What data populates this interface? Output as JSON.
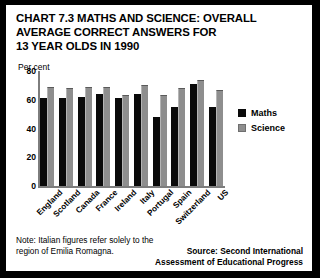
{
  "chart": {
    "title_lines": [
      "CHART 7.3 MATHS AND SCIENCE: OVERALL",
      "AVERAGE CORRECT ANSWERS FOR",
      "13 YEAR OLDS IN 1990"
    ],
    "axis_unit_label": "Per cent",
    "note": "Note: Italian figures refer solely to the region of Emilia Romagna.",
    "source_lines": [
      "Source: Second International",
      "Assessment of Educational Progress"
    ],
    "legend": [
      {
        "label": "Maths",
        "color": "#0a0a0a"
      },
      {
        "label": "Science",
        "color": "#8e8e8e"
      }
    ]
  },
  "chart_data": {
    "type": "bar",
    "title": "CHART 7.3 MATHS AND SCIENCE: OVERALL AVERAGE CORRECT ANSWERS FOR 13 YEAR OLDS IN 1990",
    "xlabel": "",
    "ylabel": "Per cent",
    "ylim": [
      0,
      80
    ],
    "yticks": [
      80,
      60,
      40,
      20,
      0
    ],
    "grid": false,
    "legend_position": "right",
    "categories": [
      "England",
      "Scotland",
      "Canada",
      "France",
      "Ireland",
      "Italy",
      "Portugal",
      "Spain",
      "Switzerland",
      "US"
    ],
    "series": [
      {
        "name": "Maths",
        "color": "#0a0a0a",
        "values": [
          61,
          61,
          62,
          64,
          61,
          64,
          48,
          55,
          71,
          55
        ]
      },
      {
        "name": "Science",
        "color": "#8e8e8e",
        "values": [
          69,
          68,
          69,
          69,
          63,
          70,
          63,
          68,
          74,
          67
        ]
      }
    ]
  }
}
